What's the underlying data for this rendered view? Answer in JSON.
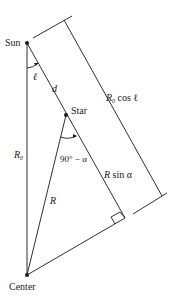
{
  "diagram": {
    "type": "geometry",
    "colors": {
      "line": "#1a1a1a",
      "background": "#ffffff"
    },
    "points": {
      "sun": {
        "label": "Sun",
        "x": 27,
        "y": 43
      },
      "star": {
        "label": "Star",
        "x": 66,
        "y": 115
      },
      "center": {
        "label": "Center",
        "x": 27,
        "y": 275
      },
      "right_angle_foot": {
        "x": 125,
        "y": 218
      }
    },
    "labels": {
      "sun": "Sun",
      "star": "Star",
      "center": "Center",
      "ell": "ℓ",
      "d": "d",
      "r0_main": "R",
      "r0_sub": "0",
      "r": "R",
      "angle": "90° − α",
      "rsin_R": "R",
      "rsin_rest": " sin α",
      "rcos_R": "R",
      "rcos_sub": "0",
      "rcos_rest": " cos ℓ"
    },
    "segments": [
      {
        "name": "sun-to-center",
        "label": "R0"
      },
      {
        "name": "sun-to-star",
        "label": "d"
      },
      {
        "name": "star-to-foot",
        "label": "R sin α"
      },
      {
        "name": "star-to-center",
        "label": "R"
      },
      {
        "name": "center-to-foot"
      },
      {
        "name": "dimension-line",
        "label": "R0 cos ℓ"
      }
    ]
  }
}
